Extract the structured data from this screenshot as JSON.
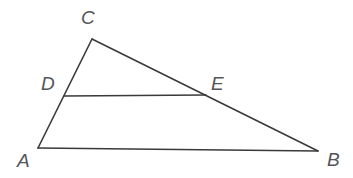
{
  "figure": {
    "type": "geometry-diagram",
    "canvas": {
      "width": 353,
      "height": 178
    },
    "background_color": "#ffffff",
    "stroke_color": "#3a3a3c",
    "label_color": "#54565a",
    "points": [
      {
        "id": "A",
        "label": "A",
        "x": 38,
        "y": 148,
        "label_x": 17,
        "label_y": 151
      },
      {
        "id": "B",
        "label": "B",
        "x": 318,
        "y": 151,
        "label_x": 327,
        "label_y": 150
      },
      {
        "id": "C",
        "label": "C",
        "x": 92,
        "y": 39,
        "label_x": 81,
        "label_y": 8
      },
      {
        "id": "D",
        "label": "D",
        "x": 64,
        "y": 96,
        "label_x": 41,
        "label_y": 74
      },
      {
        "id": "E",
        "label": "E",
        "x": 206,
        "y": 95,
        "label_x": 211,
        "label_y": 74
      }
    ],
    "segments": [
      {
        "id": "AB",
        "from": "A",
        "to": "B",
        "kind": "triangle-side"
      },
      {
        "id": "AC",
        "from": "A",
        "to": "C",
        "kind": "triangle-side"
      },
      {
        "id": "CB",
        "from": "C",
        "to": "B",
        "kind": "triangle-side"
      },
      {
        "id": "DE",
        "from": "D",
        "to": "E",
        "kind": "cevian"
      }
    ]
  }
}
